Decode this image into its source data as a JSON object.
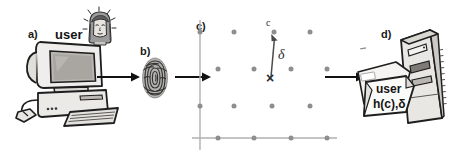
{
  "figure": {
    "background_color": "#ffffff",
    "width": 449,
    "height": 167
  },
  "panels": [
    {
      "id": "a",
      "label": "a)",
      "caption": "user",
      "icons": [
        "user-head-icon",
        "desktop-computer-icon"
      ]
    },
    {
      "id": "b",
      "label": "b)",
      "caption": "",
      "icons": [
        "fingerprint-icon"
      ]
    },
    {
      "id": "c",
      "label": "c)",
      "caption": "",
      "icons": [
        "lattice-diagram"
      ]
    },
    {
      "id": "d",
      "label": "d)",
      "caption": "",
      "icons": [
        "server-tower-icon",
        "document-stack-icon"
      ]
    }
  ],
  "lattice": {
    "point_label_c": "c",
    "offset_label_delta": "δ",
    "sample_marker": "×",
    "dot_color": "#8e8e8e",
    "axis_color": "#a8a8a8",
    "vector_color": "#4a4a4a",
    "rows": [
      {
        "y": 18,
        "xs": [
          8,
          42,
          80,
          118
        ]
      },
      {
        "y": 55,
        "xs": [
          26,
          62,
          99,
          135
        ]
      },
      {
        "y": 92,
        "xs": [
          8,
          42,
          80,
          118
        ]
      },
      {
        "y": 124,
        "xs": [
          26,
          62,
          99,
          135
        ]
      }
    ],
    "c_point": {
      "x": 82,
      "y": 18
    },
    "x_point": {
      "x": 79,
      "y": 64
    }
  },
  "documents": {
    "front_line_1": "user",
    "front_line_2": "h(c),δ",
    "back_scribble": "••••"
  },
  "arrows": [
    {
      "name": "arrow-a-to-b",
      "x": 96,
      "y": 77,
      "length": 40
    },
    {
      "name": "arrow-b-to-c",
      "x": 174,
      "y": 76,
      "length": 34
    },
    {
      "name": "arrow-c-to-d",
      "x": 324,
      "y": 76,
      "length": 38
    }
  ],
  "colors": {
    "ink": "#141414",
    "gray_mid": "#8e8e8e",
    "gray_light": "#cfcfcf",
    "gray_dark": "#4a4a4a",
    "paper": "#f2f1ee"
  }
}
